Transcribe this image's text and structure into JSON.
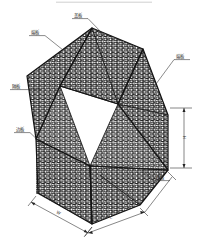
{
  "drawing": {
    "title": "石笼网箱结构示意图",
    "type": "gabion-box-isometric",
    "top_rule": true,
    "line_color": "#141414",
    "text_color": "#2a2a2a",
    "background": "#ffffff",
    "mesh": {
      "pattern": "hexagonal-woven-wire",
      "cell_width": 5.2,
      "cell_height": 4.2,
      "wire_color": "#111111"
    }
  },
  "callouts": [
    {
      "id": "cover",
      "label": "盖板",
      "text_x": 74,
      "text_y": 17,
      "ul_x1": 72,
      "ul_x2": 88,
      "ul_y": 18.6,
      "leader": "M88,18.6 L104,35"
    },
    {
      "id": "end-left",
      "label": "端板",
      "text_x": 31,
      "text_y": 34,
      "ul_x1": 29,
      "ul_x2": 45,
      "ul_y": 35.6,
      "leader": "M45,35.6 L63,50"
    },
    {
      "id": "diaphragm",
      "label": "隔板",
      "text_x": 12,
      "text_y": 88,
      "ul_x1": 10,
      "ul_x2": 26,
      "ul_y": 89.6,
      "leader": "M26,89.6 L40,89.6"
    },
    {
      "id": "side",
      "label": "边板",
      "text_x": 16,
      "text_y": 131,
      "ul_x1": 14,
      "ul_x2": 30,
      "ul_y": 132.6,
      "leader": "M30,132.6 L45,147"
    },
    {
      "id": "end-right",
      "label": "端板",
      "text_x": 176,
      "text_y": 58,
      "ul_x1": 174,
      "ul_x2": 190,
      "ul_y": 59.6,
      "leader": "M174,59.6 L156,82"
    },
    {
      "id": "base",
      "label": "底板",
      "text_x": 156,
      "text_y": 179,
      "ul_x1": 154,
      "ul_x2": 170,
      "ul_y": 180.6,
      "leader": "M154,180.6 L140,166"
    }
  ],
  "dimensions": [
    {
      "id": "height",
      "label": "H",
      "orientation": "vertical",
      "text_x": 186,
      "text_y": 137
    },
    {
      "id": "width",
      "label": "W",
      "orientation": "oblique-left",
      "text_x": 57,
      "text_y": 206
    },
    {
      "id": "length",
      "label": "L",
      "orientation": "oblique-right",
      "text_x": 112,
      "text_y": 216
    }
  ]
}
